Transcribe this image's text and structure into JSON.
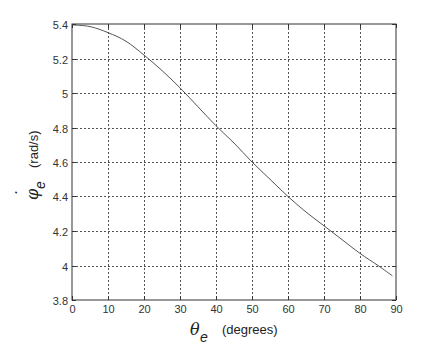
{
  "chart_data": {
    "type": "line",
    "title": "",
    "xlabel": "θe (degrees)",
    "ylabel": "φ̇e (rad/s)",
    "xlabel_parts": {
      "symbol": "θ",
      "subscript": "e",
      "unit": "(degrees)"
    },
    "ylabel_parts": {
      "symbol": "φ",
      "dot": "˙",
      "subscript": "e",
      "unit": "(rad/s)"
    },
    "xlim": [
      0,
      90
    ],
    "ylim": [
      3.8,
      5.4
    ],
    "xticks": [
      0,
      10,
      20,
      30,
      40,
      50,
      60,
      70,
      80,
      90
    ],
    "yticks": [
      3.8,
      4,
      4.2,
      4.4,
      4.6,
      4.8,
      5,
      5.2,
      5.4
    ],
    "xtick_labels": [
      "0",
      "10",
      "20",
      "30",
      "40",
      "50",
      "60",
      "70",
      "80",
      "90"
    ],
    "ytick_labels": [
      "3.8",
      "4",
      "4.2",
      "4.4",
      "4.6",
      "4.8",
      "5",
      "5.2",
      "5.4"
    ],
    "grid": true,
    "legend": null,
    "series": [
      {
        "name": "phi_dot_e",
        "color": "#555555",
        "x": [
          0,
          5,
          10,
          15,
          20,
          25,
          30,
          35,
          40,
          45,
          50,
          55,
          60,
          65,
          70,
          75,
          80,
          85,
          89
        ],
        "values": [
          5.395,
          5.385,
          5.35,
          5.3,
          5.22,
          5.13,
          5.03,
          4.92,
          4.81,
          4.71,
          4.6,
          4.5,
          4.4,
          4.31,
          4.23,
          4.15,
          4.07,
          4.0,
          3.94
        ]
      }
    ]
  }
}
